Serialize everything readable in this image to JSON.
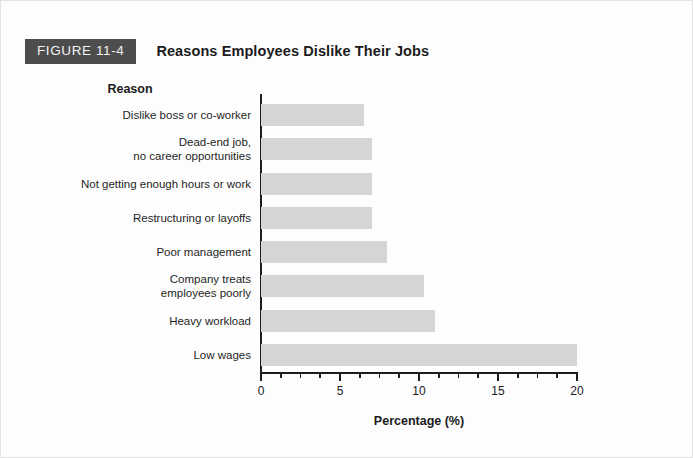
{
  "figure": {
    "badge_label": "FIGURE 11-4",
    "title": "Reasons Employees Dislike Their Jobs",
    "badge_bg_color": "#4d4d4d",
    "badge_text_color": "#f2f2f2"
  },
  "chart_data": {
    "type": "bar",
    "orientation": "horizontal",
    "title": "Reasons Employees Dislike Their Jobs",
    "categories": [
      "Dislike boss or co-worker",
      "Dead-end job,\nno career opportunities",
      "Not getting enough hours or work",
      "Restructuring or layoffs",
      "Poor management",
      "Company treats\nemployees poorly",
      "Heavy workload",
      "Low wages"
    ],
    "category_lines": [
      [
        "Dislike boss or co-worker"
      ],
      [
        "Dead-end job,",
        "no career opportunities"
      ],
      [
        "Not getting enough hours or work"
      ],
      [
        "Restructuring or layoffs"
      ],
      [
        "Poor management"
      ],
      [
        "Company treats",
        "employees poorly"
      ],
      [
        "Heavy workload"
      ],
      [
        "Low wages"
      ]
    ],
    "values": [
      6.5,
      7,
      7,
      7,
      8,
      10.3,
      11,
      20
    ],
    "xlabel": "Percentage (%)",
    "ylabel": "Reason",
    "xlim": [
      0,
      20
    ],
    "xticks": [
      0,
      5,
      10,
      15,
      20
    ],
    "xtick_labels": [
      "0",
      "5",
      "10",
      "15",
      "20"
    ],
    "minor_tick_interval": 1.25,
    "grid": false,
    "legend": false,
    "bar_color": "#d5d5d5",
    "axis_color": "#1d1d1d"
  }
}
